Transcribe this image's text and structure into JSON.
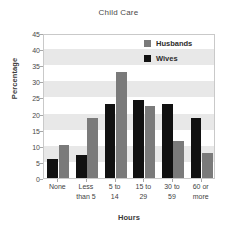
{
  "chart_data": {
    "type": "bar",
    "title": "Child Care",
    "xlabel": "Hours",
    "ylabel": "Percentage",
    "categories": [
      "None",
      "Less than 5",
      "5 to 14",
      "15 to 29",
      "30 to 59",
      "60 or more"
    ],
    "category_lines": [
      [
        "None"
      ],
      [
        "Less",
        "than 5"
      ],
      [
        "5 to",
        "14"
      ],
      [
        "15 to",
        "29"
      ],
      [
        "30 to",
        "59"
      ],
      [
        "60 or",
        "more"
      ]
    ],
    "series": [
      {
        "name": "Wives",
        "color": "#111111",
        "values": [
          6,
          7,
          23,
          24.2,
          23,
          18.7
        ]
      },
      {
        "name": "Husbands",
        "color": "#7a7a7a",
        "values": [
          10.2,
          18.7,
          32.8,
          22.3,
          11.5,
          7.7
        ]
      }
    ],
    "ylim": [
      0,
      45
    ],
    "yticks": [
      0,
      5,
      10,
      15,
      20,
      25,
      30,
      35,
      40,
      45
    ],
    "ytick_labels": [
      "0",
      "5",
      "10",
      "15",
      "20",
      "25",
      "30",
      "35",
      "40",
      "45"
    ],
    "grid": false,
    "banded_background": true,
    "band_color": "#e8e8e8",
    "legend_position": "top-right",
    "legend": [
      {
        "label": "Husbands",
        "color": "#7a7a7a"
      },
      {
        "label": "Wives",
        "color": "#111111"
      }
    ]
  }
}
